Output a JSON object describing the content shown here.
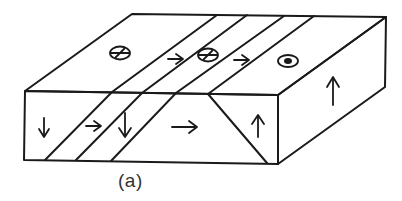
{
  "figure": {
    "caption": "(a)",
    "type": "block diagram of faults (strike-slip / dip-slip motion indicators)",
    "colors": {
      "line": "#1a1a1a",
      "background": "#ffffff"
    },
    "symbols": {
      "top_face": [
        {
          "name": "tail-cross-symbol",
          "meaning": "motion into page"
        },
        {
          "name": "right-arrow",
          "meaning": "motion to right"
        },
        {
          "name": "tail-cross-symbol",
          "meaning": "motion into page"
        },
        {
          "name": "right-arrow",
          "meaning": "motion to right"
        },
        {
          "name": "dot-symbol",
          "meaning": "motion out of page"
        }
      ],
      "front_face": [
        {
          "name": "down-arrow"
        },
        {
          "name": "right-arrow"
        },
        {
          "name": "down-arrow"
        },
        {
          "name": "right-arrow"
        },
        {
          "name": "up-arrow"
        }
      ],
      "side_face": [
        {
          "name": "up-arrow"
        }
      ]
    }
  }
}
